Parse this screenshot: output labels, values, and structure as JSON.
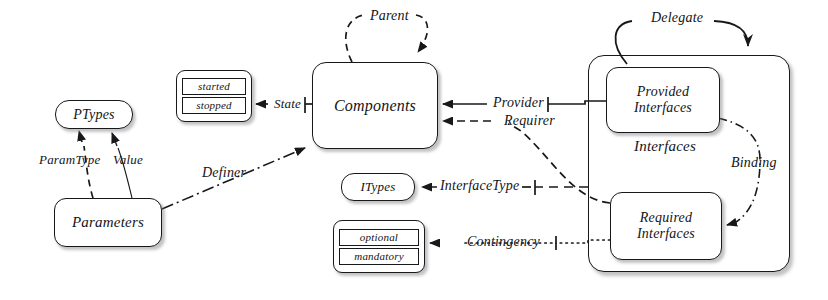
{
  "diagram": {
    "background_color": "#ffffff",
    "line_color": "#16181a",
    "text_color": "#131416"
  },
  "nodes": {
    "ptypes": {
      "label": "PTypes",
      "x": 55,
      "y": 100,
      "w": 78,
      "h": 29,
      "radius": 14,
      "font_size": 14
    },
    "parameters": {
      "label": "Parameters",
      "x": 54,
      "y": 198,
      "w": 108,
      "h": 49,
      "radius": 12,
      "font_size": 15
    },
    "components": {
      "label": "Components",
      "x": 312,
      "y": 62,
      "w": 126,
      "h": 87,
      "radius": 14,
      "font_size": 16
    },
    "itypes": {
      "label": "ITypes",
      "x": 341,
      "y": 173,
      "w": 74,
      "h": 28,
      "radius": 13,
      "font_size": 13
    },
    "provided_interfaces": {
      "label": "Provided\nInterfaces",
      "line1": "Provided",
      "line2": "Interfaces",
      "x": 606,
      "y": 67,
      "w": 114,
      "h": 66,
      "radius": 12,
      "font_size": 14
    },
    "required_interfaces": {
      "label": "Required\nInterfaces",
      "line1": "Required",
      "line2": "Interfaces",
      "x": 610,
      "y": 192,
      "w": 112,
      "h": 68,
      "radius": 12,
      "font_size": 14
    }
  },
  "containers": {
    "interfaces": {
      "label": "Interfaces",
      "x": 588,
      "y": 55,
      "w": 202,
      "h": 217,
      "font_size": 15,
      "label_x": 634,
      "label_y": 148
    }
  },
  "enumerations": {
    "component_state": {
      "name": "component-state-enum",
      "x": 176,
      "y": 70,
      "w": 76,
      "h": 52,
      "values": [
        "started",
        "stopped"
      ]
    },
    "contingency_kind": {
      "name": "contingency-enum",
      "x": 333,
      "y": 220,
      "w": 92,
      "h": 53,
      "values": [
        "optional",
        "mandatory"
      ]
    }
  },
  "edges": [
    {
      "name": "parent",
      "label": "Parent",
      "style": "dashed",
      "label_x": 370,
      "label_y": 8,
      "font_size": 14,
      "source": "components",
      "target": "components",
      "arrow": "filled"
    },
    {
      "name": "delegate",
      "label": "Delegate",
      "style": "solid",
      "label_x": 651,
      "label_y": 10,
      "font_size": 14,
      "source": "interfaces",
      "target": "interfaces",
      "arrow": "open"
    },
    {
      "name": "state",
      "label": "State",
      "style": "solid",
      "label_x": 274,
      "label_y": 96,
      "font_size": 13,
      "source": "components",
      "target": "component_state",
      "arrow": "filled"
    },
    {
      "name": "paramtype",
      "label": "ParamType",
      "style": "dashed",
      "label_x": 39,
      "label_y": 152,
      "font_size": 13,
      "source": "parameters",
      "target": "ptypes",
      "arrow": "filled"
    },
    {
      "name": "value",
      "label": "Value",
      "style": "solid",
      "label_x": 112,
      "label_y": 152,
      "font_size": 13,
      "source": "parameters",
      "target": "ptypes",
      "arrow": "filled"
    },
    {
      "name": "definer",
      "label": "Definer",
      "style": "dashdot",
      "label_x": 202,
      "label_y": 165,
      "font_size": 14,
      "source": "parameters",
      "target": "components",
      "arrow": "filled"
    },
    {
      "name": "provider",
      "label": "Provider",
      "style": "solid",
      "label_x": 493,
      "label_y": 95,
      "font_size": 14,
      "source": "provided_interfaces",
      "target": "components",
      "arrow": "filled"
    },
    {
      "name": "requirer",
      "label": "Requirer",
      "style": "dashed",
      "label_x": 504,
      "label_y": 113,
      "font_size": 14,
      "source": "required_interfaces",
      "target": "components",
      "arrow": "filled"
    },
    {
      "name": "interfacetype",
      "label": "InterfaceType",
      "style": "dashed",
      "label_x": 440,
      "label_y": 178,
      "font_size": 14,
      "source": "interfaces",
      "target": "itypes",
      "arrow": "filled"
    },
    {
      "name": "contingency",
      "label": "Contingency",
      "style": "dotted",
      "label_x": 467,
      "label_y": 234,
      "font_size": 14,
      "source": "required_interfaces",
      "target": "contingency_kind",
      "arrow": "filled"
    },
    {
      "name": "binding",
      "label": "Binding",
      "style": "dashdot",
      "label_x": 731,
      "label_y": 155,
      "font_size": 14,
      "source": "provided_interfaces",
      "target": "required_interfaces",
      "arrow": "filled"
    }
  ]
}
